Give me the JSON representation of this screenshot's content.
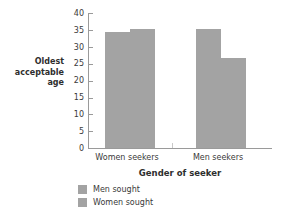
{
  "chart_data": {
    "type": "bar",
    "title": "",
    "xlabel": "Gender of seeker",
    "ylabel": "Oldest acceptable age",
    "ylabel_lines": [
      "Oldest",
      "acceptable",
      "age"
    ],
    "categories": [
      "Women seekers",
      "Men seekers"
    ],
    "series": [
      {
        "name": "Men sought",
        "values": [
          34.3,
          35.4
        ]
      },
      {
        "name": "Women sought",
        "values": [
          35.4,
          26.6
        ]
      }
    ],
    "ylim": [
      0,
      40
    ],
    "yticks": [
      40,
      35,
      30,
      25,
      20,
      15,
      10,
      5,
      0
    ],
    "grid": false,
    "legend_position": "below",
    "bar_color": "#a3a3a3",
    "axis_color": "#9a9a9a",
    "text_color": "#3a3a3a"
  },
  "legend": {
    "items": [
      {
        "label": "Men sought"
      },
      {
        "label": "Women sought"
      }
    ]
  }
}
